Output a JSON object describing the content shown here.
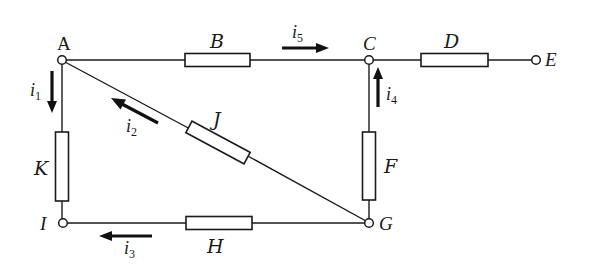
{
  "diagram": {
    "type": "circuit",
    "nodes": [
      {
        "id": "A",
        "label": "A"
      },
      {
        "id": "C",
        "label": "C"
      },
      {
        "id": "E",
        "label": "E"
      },
      {
        "id": "G",
        "label": "G"
      },
      {
        "id": "I",
        "label": "I"
      }
    ],
    "resistors": [
      {
        "id": "B",
        "label": "B",
        "from": "A",
        "to": "C"
      },
      {
        "id": "D",
        "label": "D",
        "from": "C",
        "to": "E"
      },
      {
        "id": "F",
        "label": "F",
        "from": "G",
        "to": "C"
      },
      {
        "id": "H",
        "label": "H",
        "from": "G",
        "to": "I"
      },
      {
        "id": "J",
        "label": "J",
        "from": "G",
        "to": "A"
      },
      {
        "id": "K",
        "label": "K",
        "from": "A",
        "to": "I"
      }
    ],
    "currents": [
      {
        "id": "i1",
        "symbol": "i",
        "sub": "1",
        "branch": "K",
        "direction": "down (A to I)"
      },
      {
        "id": "i2",
        "symbol": "i",
        "sub": "2",
        "branch": "J",
        "direction": "toward A (G to A)"
      },
      {
        "id": "i3",
        "symbol": "i",
        "sub": "3",
        "branch": "H",
        "direction": "left (G to I)"
      },
      {
        "id": "i4",
        "symbol": "i",
        "sub": "4",
        "branch": "F",
        "direction": "up (G to C)"
      },
      {
        "id": "i5",
        "symbol": "i",
        "sub": "5",
        "branch": "B",
        "direction": "right (A to C)"
      }
    ],
    "colors": {
      "line": "#1a1a1a",
      "background": "#ffffff"
    }
  },
  "labels": {
    "A": "A",
    "B": "B",
    "C": "C",
    "D": "D",
    "E": "E",
    "F": "F",
    "G": "G",
    "H": "H",
    "I": "I",
    "J": "J",
    "K": "K"
  },
  "currents": {
    "i1": {
      "symbol": "i",
      "sub": "1"
    },
    "i2": {
      "symbol": "i",
      "sub": "2"
    },
    "i3": {
      "symbol": "i",
      "sub": "3"
    },
    "i4": {
      "symbol": "i",
      "sub": "4"
    },
    "i5": {
      "symbol": "i",
      "sub": "5"
    }
  }
}
